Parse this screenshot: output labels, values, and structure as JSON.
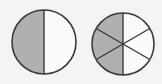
{
  "diagram": {
    "colors": {
      "background": "#f4f4f4",
      "shaded": "#b0b0b0",
      "unshaded": "#fafafa",
      "stroke": "#3a3a3a"
    },
    "circles": [
      {
        "name": "halves",
        "parts": 2,
        "shaded": 1
      },
      {
        "name": "sixths",
        "parts": 6,
        "shaded": 3
      }
    ]
  }
}
